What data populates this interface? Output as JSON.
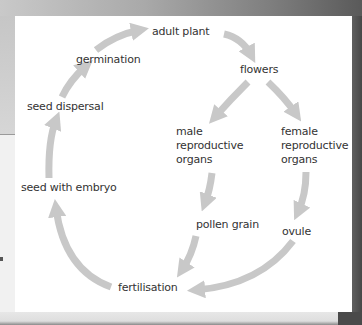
{
  "diagram": {
    "arrow_color": "#c8c8c8",
    "text_color": "#333333",
    "nodes": {
      "adult_plant": "adult plant",
      "flowers": "flowers",
      "male": [
        "male",
        "reproductive",
        "organs"
      ],
      "female": [
        "female",
        "reproductive",
        "organs"
      ],
      "pollen_grain": "pollen grain",
      "ovule": "ovule",
      "fertilisation": "fertilisation",
      "seed_with_embryo": "seed with embryo",
      "seed_dispersal": "seed dispersal",
      "germination": "germination"
    },
    "edges": [
      {
        "from": "adult plant",
        "to": "flowers"
      },
      {
        "from": "flowers",
        "to": "male reproductive organs"
      },
      {
        "from": "flowers",
        "to": "female reproductive organs"
      },
      {
        "from": "male reproductive organs",
        "to": "pollen grain"
      },
      {
        "from": "female reproductive organs",
        "to": "ovule"
      },
      {
        "from": "pollen grain",
        "to": "fertilisation"
      },
      {
        "from": "ovule",
        "to": "fertilisation"
      },
      {
        "from": "fertilisation",
        "to": "seed with embryo"
      },
      {
        "from": "seed with embryo",
        "to": "seed dispersal"
      },
      {
        "from": "seed dispersal",
        "to": "germination"
      },
      {
        "from": "germination",
        "to": "adult plant"
      }
    ]
  }
}
